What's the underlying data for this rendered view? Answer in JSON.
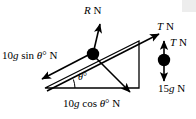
{
  "figure": {
    "type": "physics-force-diagram",
    "background_color": "#ffffff",
    "stroke_color": "#000000"
  },
  "labels": {
    "normal_reaction": {
      "italic": "R",
      "upright": " N",
      "full": "R N"
    },
    "tension_incline": {
      "italic": "T",
      "upright": " N",
      "full": "T N"
    },
    "tension_hanging": {
      "italic": "T",
      "upright": " N",
      "full": "T N"
    },
    "weight_hanging": {
      "upright_prefix": "15",
      "italic": "g",
      "upright_suffix": " N",
      "full": "15g N"
    },
    "weight_component_parallel": {
      "upright_prefix": "10",
      "italic": "g",
      "upright_mid": " sin ",
      "italic_angle": "θ",
      "upright_suffix": "° N",
      "full": "10g sin θ° N"
    },
    "weight_component_perpendicular": {
      "upright_prefix": "10",
      "italic": "g",
      "upright_mid": " cos ",
      "italic_angle": "θ",
      "upright_suffix": "° N",
      "full": "10g cos θ° N"
    },
    "incline_angle": {
      "italic": "θ",
      "upright": "°",
      "full": "θ°"
    }
  },
  "geometry": {
    "triangle": {
      "left_vertex": [
        45,
        88
      ],
      "apex": [
        139,
        41
      ],
      "right_vertex": [
        139,
        88
      ]
    },
    "block_on_incline": {
      "cx": 93,
      "cy": 54,
      "r": 6
    },
    "hanging_mass": {
      "cx": 164,
      "cy": 60,
      "r": 6
    },
    "arrows": [
      {
        "name": "normal-reaction-arrow",
        "from": [
          93,
          54
        ],
        "to": [
          100,
          26
        ],
        "head": "to"
      },
      {
        "name": "tension-up-incline-arrow",
        "from": [
          48,
          90
        ],
        "to": [
          160,
          33
        ],
        "head": "to"
      },
      {
        "name": "weight-parallel-arrow",
        "from": [
          95,
          52
        ],
        "to": [
          44,
          79
        ],
        "head": "to"
      },
      {
        "name": "weight-perpendicular-arrow",
        "from": [
          93,
          55
        ],
        "to": [
          129,
          90
        ],
        "head": "to"
      },
      {
        "name": "hanging-tension-weight-arrow",
        "from": [
          164,
          42
        ],
        "to": [
          164,
          80
        ],
        "head": "both"
      }
    ],
    "angle_arc": {
      "vertex": [
        45,
        88
      ],
      "radius": 30
    }
  }
}
